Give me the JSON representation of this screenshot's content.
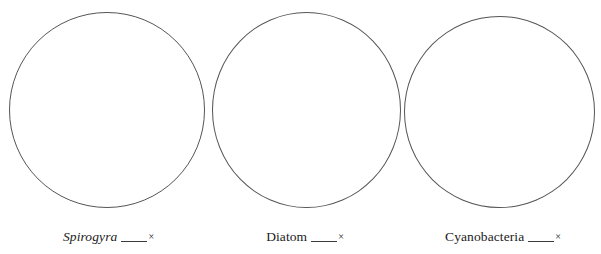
{
  "page": {
    "clipped_header_fragment": "",
    "background_color": "#ffffff",
    "stroke_color": "#555558",
    "text_color": "#1b1b1b"
  },
  "worksheet": {
    "specimens": [
      {
        "name": "Spirogyra",
        "italic": true,
        "blank_value": "",
        "magnification_symbol": "×",
        "circle_name": "drawing-circle-spirogyra"
      },
      {
        "name": "Diatom",
        "italic": false,
        "blank_value": "",
        "magnification_symbol": "×",
        "circle_name": "drawing-circle-diatom"
      },
      {
        "name": "Cyanobacteria",
        "italic": false,
        "blank_value": "",
        "magnification_symbol": "×",
        "circle_name": "drawing-circle-cyanobacteria"
      }
    ]
  }
}
